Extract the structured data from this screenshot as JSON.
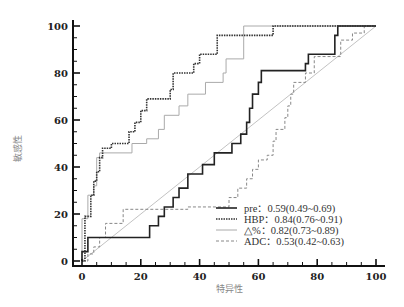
{
  "chart_data": {
    "type": "line",
    "title": "",
    "xlabel": "特异性",
    "ylabel": "敏感性",
    "xlim": [
      0,
      100
    ],
    "ylim": [
      0,
      100
    ],
    "x_ticks": [
      0,
      20,
      40,
      60,
      80,
      100
    ],
    "y_ticks": [
      0,
      20,
      40,
      60,
      80,
      100
    ],
    "grid": false,
    "legend_position": "lower right",
    "series": [
      {
        "name": "pre",
        "label": "pre：0.59(0.49~0.69)",
        "auc": 0.59,
        "ci": [
          0.49,
          0.69
        ],
        "style": "solid",
        "color": "#222222",
        "width": 1.6,
        "points": [
          [
            0,
            0
          ],
          [
            0,
            4
          ],
          [
            2,
            4
          ],
          [
            2,
            10
          ],
          [
            23,
            10
          ],
          [
            23,
            15
          ],
          [
            26,
            15
          ],
          [
            26,
            19
          ],
          [
            28,
            19
          ],
          [
            28,
            23
          ],
          [
            31,
            23
          ],
          [
            31,
            27
          ],
          [
            33,
            27
          ],
          [
            33,
            31
          ],
          [
            36,
            31
          ],
          [
            36,
            37
          ],
          [
            41,
            37
          ],
          [
            41,
            41
          ],
          [
            45,
            41
          ],
          [
            45,
            46
          ],
          [
            51,
            46
          ],
          [
            51,
            50
          ],
          [
            54,
            50
          ],
          [
            54,
            54
          ],
          [
            56,
            54
          ],
          [
            56,
            59
          ],
          [
            57,
            59
          ],
          [
            57,
            65
          ],
          [
            58,
            65
          ],
          [
            58,
            71
          ],
          [
            60,
            71
          ],
          [
            60,
            76
          ],
          [
            61,
            76
          ],
          [
            61,
            81
          ],
          [
            76,
            81
          ],
          [
            76,
            84
          ],
          [
            77,
            84
          ],
          [
            77,
            88
          ],
          [
            86,
            88
          ],
          [
            86,
            96
          ],
          [
            87,
            96
          ],
          [
            87,
            100
          ],
          [
            100,
            100
          ]
        ]
      },
      {
        "name": "HBP",
        "label": "HBP：0.84(0.76~0.91)",
        "auc": 0.84,
        "ci": [
          0.76,
          0.91
        ],
        "style": "dotted",
        "color": "#333333",
        "width": 1.6,
        "points": [
          [
            0,
            0
          ],
          [
            1,
            0
          ],
          [
            1,
            19
          ],
          [
            3,
            19
          ],
          [
            3,
            28
          ],
          [
            4,
            28
          ],
          [
            4,
            34
          ],
          [
            5,
            34
          ],
          [
            5,
            38
          ],
          [
            6,
            38
          ],
          [
            6,
            44
          ],
          [
            7,
            44
          ],
          [
            7,
            48
          ],
          [
            10,
            48
          ],
          [
            10,
            50
          ],
          [
            16,
            50
          ],
          [
            16,
            55
          ],
          [
            18,
            55
          ],
          [
            18,
            59
          ],
          [
            20,
            59
          ],
          [
            20,
            64
          ],
          [
            22,
            64
          ],
          [
            22,
            69
          ],
          [
            30,
            69
          ],
          [
            30,
            73
          ],
          [
            31,
            73
          ],
          [
            31,
            80
          ],
          [
            38,
            80
          ],
          [
            38,
            84
          ],
          [
            40,
            84
          ],
          [
            40,
            88
          ],
          [
            46,
            88
          ],
          [
            46,
            96
          ],
          [
            65,
            96
          ],
          [
            65,
            100
          ],
          [
            100,
            100
          ]
        ]
      },
      {
        "name": "delta_percent",
        "label": "△%：0.82(0.73~0.89)",
        "auc": 0.82,
        "ci": [
          0.73,
          0.89
        ],
        "style": "solid",
        "color": "#aaaaaa",
        "width": 1.0,
        "points": [
          [
            0,
            0
          ],
          [
            0,
            18
          ],
          [
            2,
            18
          ],
          [
            2,
            28
          ],
          [
            4,
            28
          ],
          [
            4,
            32
          ],
          [
            5,
            32
          ],
          [
            5,
            44
          ],
          [
            6,
            44
          ],
          [
            6,
            46
          ],
          [
            17,
            46
          ],
          [
            17,
            50
          ],
          [
            22,
            50
          ],
          [
            22,
            52
          ],
          [
            26,
            52
          ],
          [
            26,
            56
          ],
          [
            28,
            56
          ],
          [
            28,
            62
          ],
          [
            33,
            62
          ],
          [
            33,
            66
          ],
          [
            36,
            66
          ],
          [
            36,
            71
          ],
          [
            42,
            71
          ],
          [
            42,
            76
          ],
          [
            48,
            76
          ],
          [
            48,
            80
          ],
          [
            49,
            80
          ],
          [
            49,
            86
          ],
          [
            55,
            86
          ],
          [
            55,
            96
          ],
          [
            55,
            100
          ],
          [
            100,
            100
          ]
        ]
      },
      {
        "name": "ADC",
        "label": "ADC：0.53(0.42~0.63)",
        "auc": 0.53,
        "ci": [
          0.42,
          0.63
        ],
        "style": "dashed",
        "color": "#888888",
        "width": 1.0,
        "points": [
          [
            0,
            0
          ],
          [
            2,
            0
          ],
          [
            2,
            3
          ],
          [
            4,
            3
          ],
          [
            4,
            6
          ],
          [
            6,
            6
          ],
          [
            6,
            10
          ],
          [
            8,
            10
          ],
          [
            8,
            16
          ],
          [
            14,
            16
          ],
          [
            14,
            22
          ],
          [
            36,
            22
          ],
          [
            36,
            23
          ],
          [
            50,
            23
          ],
          [
            50,
            27
          ],
          [
            53,
            27
          ],
          [
            53,
            31
          ],
          [
            56,
            31
          ],
          [
            56,
            35
          ],
          [
            58,
            35
          ],
          [
            58,
            39
          ],
          [
            60,
            39
          ],
          [
            60,
            43
          ],
          [
            63,
            43
          ],
          [
            63,
            45
          ],
          [
            65,
            45
          ],
          [
            65,
            51
          ],
          [
            66,
            51
          ],
          [
            66,
            56
          ],
          [
            69,
            56
          ],
          [
            69,
            61
          ],
          [
            70,
            61
          ],
          [
            70,
            66
          ],
          [
            71,
            66
          ],
          [
            71,
            71
          ],
          [
            72,
            71
          ],
          [
            72,
            76
          ],
          [
            76,
            76
          ],
          [
            76,
            80
          ],
          [
            79,
            80
          ],
          [
            79,
            87
          ],
          [
            88,
            87
          ],
          [
            88,
            94
          ],
          [
            92,
            94
          ],
          [
            92,
            97
          ],
          [
            96,
            97
          ],
          [
            96,
            100
          ],
          [
            100,
            100
          ]
        ]
      }
    ],
    "reference_line": {
      "points": [
        [
          0,
          0
        ],
        [
          100,
          100
        ]
      ],
      "color": "#bbbbbb"
    }
  }
}
